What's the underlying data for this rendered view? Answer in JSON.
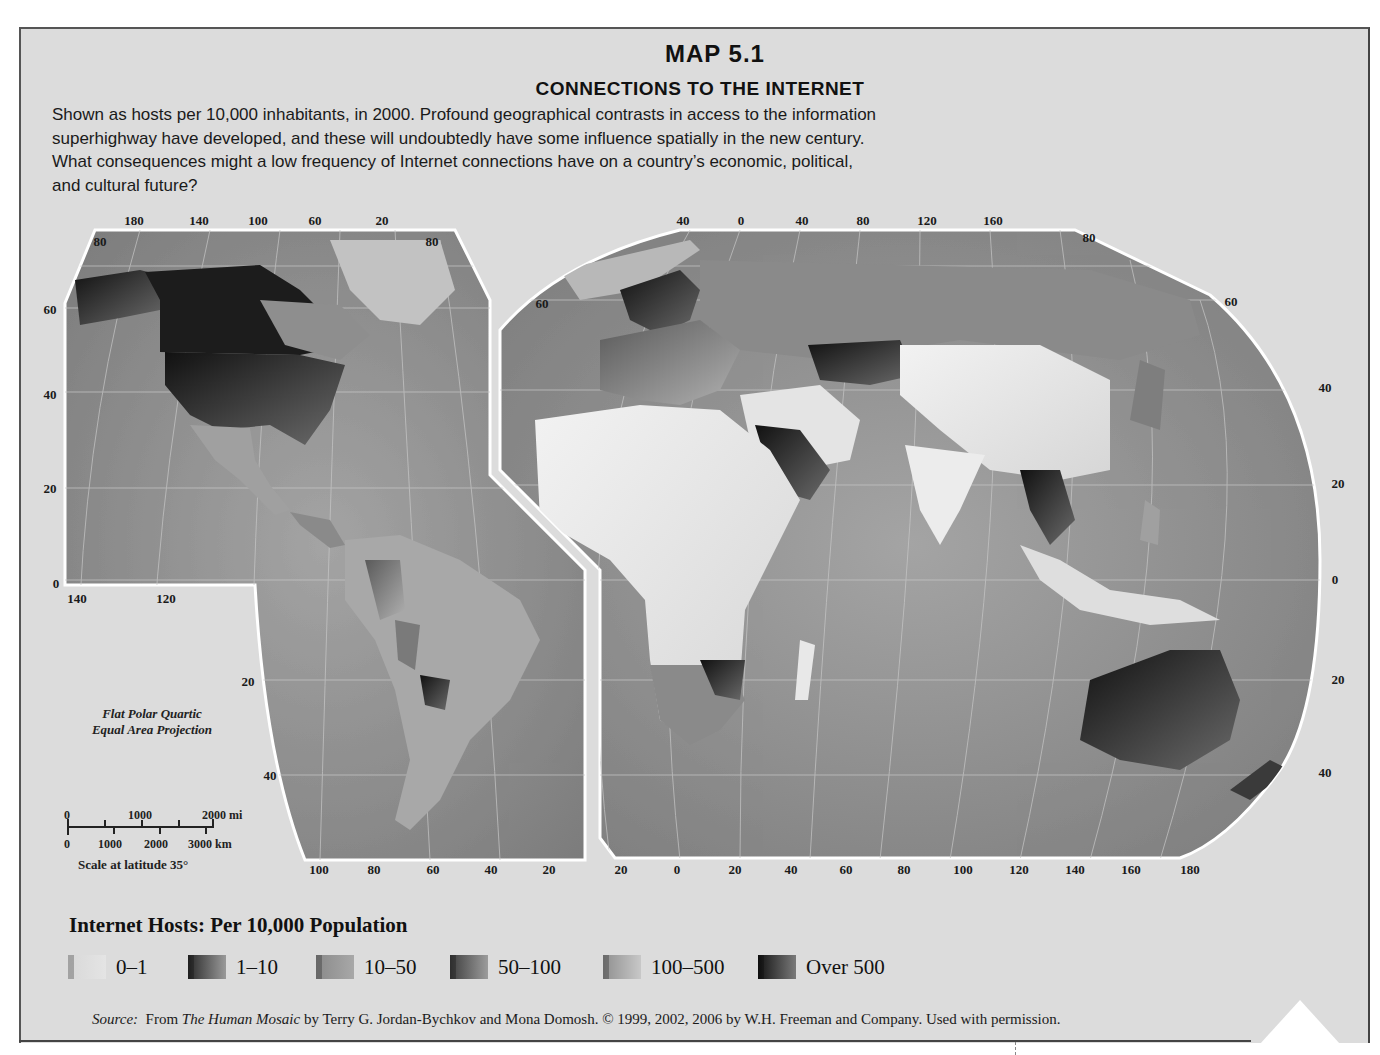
{
  "title": {
    "map_number": "MAP 5.1",
    "heading": "CONNECTIONS TO THE INTERNET"
  },
  "description": {
    "lines": [
      "Shown as hosts per 10,000 inhabitants, in 2000. Profound geographical contrasts in access to the information",
      "superhighway have developed, and these will undoubtedly have some influence spatially in the new century.",
      "What consequences might a low frequency of Internet connections have on a country’s economic, political,",
      "and cultural future?"
    ]
  },
  "left_map": {
    "top_ticks": [
      "180",
      "140",
      "100",
      "60",
      "20"
    ],
    "top_corner_left": "80",
    "top_corner_right": "80",
    "left_ticks": [
      "60",
      "40",
      "20",
      "0"
    ],
    "inner_bottom_ticks": [
      "140",
      "120"
    ],
    "inner_right_ticks": [
      "20",
      "40"
    ],
    "bottom_ticks": [
      "100",
      "80",
      "60",
      "40",
      "20"
    ]
  },
  "right_map": {
    "top_ticks": [
      "40",
      "0",
      "40",
      "80",
      "120",
      "160"
    ],
    "top_corner_right": "80",
    "left_corner": "60",
    "right_corner": "60",
    "right_ticks": [
      "40",
      "20",
      "0",
      "20",
      "40"
    ],
    "bottom_ticks": [
      "20",
      "0",
      "20",
      "40",
      "60",
      "80",
      "100",
      "120",
      "140",
      "160",
      "180"
    ]
  },
  "projection": {
    "line1": "Flat Polar Quartic",
    "line2": "Equal Area Projection"
  },
  "scale_bar": {
    "mi_labels": [
      "0",
      "1000",
      "2000 mi"
    ],
    "km_labels": [
      "0",
      "1000",
      "2000",
      "3000 km"
    ],
    "caption": "Scale at latitude 35°"
  },
  "legend": {
    "title": "Internet Hosts: Per 10,000 Population",
    "items": [
      {
        "label": "0–1",
        "color_light": "#e4e4e4",
        "color_dark": "#d8d8d8"
      },
      {
        "label": "1–10",
        "color_light": "#9a9a9a",
        "color_dark": "#2a2a2a"
      },
      {
        "label": "10–50",
        "color_light": "#a8a8a8",
        "color_dark": "#8a8a8a"
      },
      {
        "label": "50–100",
        "color_light": "#9c9c9c",
        "color_dark": "#3e3e3e"
      },
      {
        "label": "100–500",
        "color_light": "#c8c8c8",
        "color_dark": "#8f8f8f"
      },
      {
        "label": "Over 500",
        "color_light": "#7a7a7a",
        "color_dark": "#141414"
      }
    ]
  },
  "source": {
    "label": "Source:",
    "prefix": "From ",
    "book": "The Human Mosaic",
    "rest": " by Terry G. Jordan-Bychkov and Mona Domosh. © 1999, 2002, 2006 by W.H. Freeman and Company. Used with permission."
  },
  "colors": {
    "page": "#dcdcdc",
    "ocean": "#8a8a8a",
    "land_low": "#e6e6e6",
    "land_mid": "#9e9e9e",
    "land_high": "#2a2a2a"
  }
}
